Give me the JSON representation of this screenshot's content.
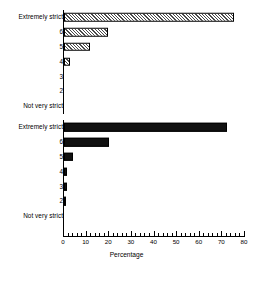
{
  "chart_data": {
    "type": "bar",
    "orientation": "horizontal",
    "title": "",
    "xlabel": "Percentage",
    "ylabel": "",
    "xlim": [
      0,
      80
    ],
    "xticks": [
      0,
      10,
      20,
      30,
      40,
      50,
      60,
      70,
      80
    ],
    "xtick_labels": [
      "0",
      "10",
      "20",
      "30",
      "40",
      "50",
      "60",
      "70",
      "80"
    ],
    "minor_tick_step": 2,
    "grid": false,
    "legend": "none",
    "categories": [
      "Extremely strict",
      "6",
      "5",
      "4",
      "3",
      "2",
      "Not very strict"
    ],
    "series": [
      {
        "name": "upper-group",
        "fill": "hatched",
        "color": "#4a4a4a",
        "values": [
          75,
          19.5,
          11.5,
          2.5,
          0,
          0,
          0
        ]
      },
      {
        "name": "lower-group",
        "fill": "solid",
        "color": "#111111",
        "values": [
          72,
          20,
          4,
          1.5,
          1.5,
          1,
          0
        ]
      }
    ]
  },
  "axis": {
    "xlabel": "Percentage"
  },
  "panels": {
    "top": {
      "rows": [
        {
          "label": "Extremely strict",
          "value": 75
        },
        {
          "label": "6",
          "value": 19.5
        },
        {
          "label": "5",
          "value": 11.5
        },
        {
          "label": "4",
          "value": 2.5
        },
        {
          "label": "3",
          "value": 0
        },
        {
          "label": "2",
          "value": 0
        },
        {
          "label": "Not very strict",
          "value": 0
        }
      ]
    },
    "bottom": {
      "rows": [
        {
          "label": "Extremely strict",
          "value": 72
        },
        {
          "label": "6",
          "value": 20
        },
        {
          "label": "5",
          "value": 4
        },
        {
          "label": "4",
          "value": 1.5
        },
        {
          "label": "3",
          "value": 1.5
        },
        {
          "label": "2",
          "value": 1
        },
        {
          "label": "Not very strict",
          "value": 0
        }
      ]
    }
  }
}
